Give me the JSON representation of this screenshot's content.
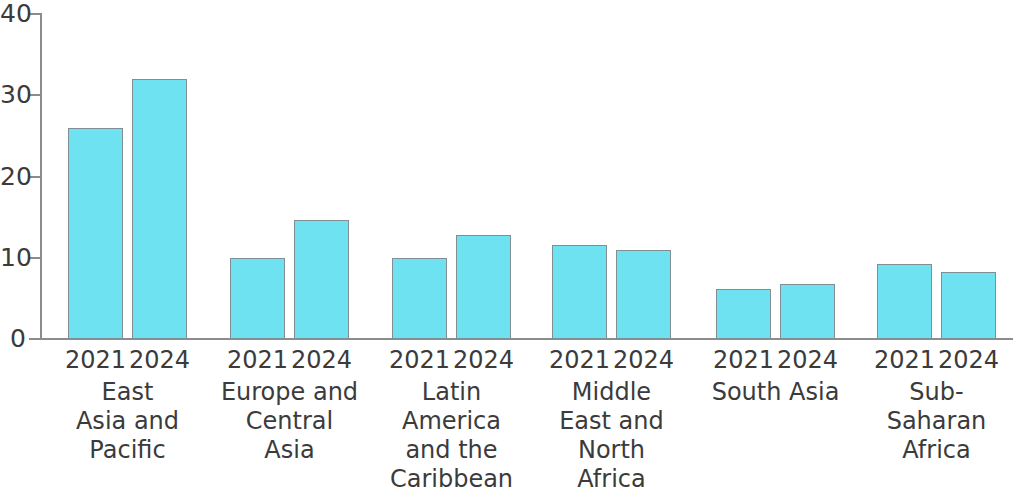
{
  "chart_data": {
    "type": "bar",
    "title": "",
    "subtitle": "",
    "xlabel": "",
    "ylabel": "",
    "ylim": [
      0,
      40
    ],
    "yticks": [
      0,
      10,
      20,
      30,
      40
    ],
    "ytick_labels": [
      "0",
      "10",
      "20",
      "30",
      "40"
    ],
    "grid": false,
    "legend": "none",
    "categories": [
      "East Asia and Pacific",
      "Europe and Central Asia",
      "Latin America and the Caribbean",
      "Middle East and North Africa",
      "South Asia",
      "Sub-Saharan Africa"
    ],
    "sub_categories": [
      "2021",
      "2024"
    ],
    "series": [
      {
        "name": "2021",
        "values": [
          26.0,
          10.0,
          10.0,
          11.6,
          6.2,
          9.2
        ]
      },
      {
        "name": "2024",
        "values": [
          32.0,
          14.7,
          12.8,
          10.9,
          6.8,
          8.3
        ]
      }
    ],
    "colors": {
      "bar_fill": "#6FE2F2",
      "bar_border": "#7f8f93",
      "axis": "#8c8c8c",
      "text": "#3b3b3b",
      "background": "#ffffff"
    }
  },
  "groups": [
    {
      "label": "East\nAsia and\nPacific",
      "bars": [
        {
          "year": "2021",
          "value": 26.0
        },
        {
          "year": "2024",
          "value": 32.0
        }
      ]
    },
    {
      "label": "Europe and\nCentral\nAsia",
      "bars": [
        {
          "year": "2021",
          "value": 10.0
        },
        {
          "year": "2024",
          "value": 14.7
        }
      ]
    },
    {
      "label": "Latin\nAmerica\nand the\nCaribbean",
      "bars": [
        {
          "year": "2021",
          "value": 10.0
        },
        {
          "year": "2024",
          "value": 12.8
        }
      ]
    },
    {
      "label": "Middle\nEast and\nNorth\nAfrica",
      "bars": [
        {
          "year": "2021",
          "value": 11.6
        },
        {
          "year": "2024",
          "value": 10.9
        }
      ]
    },
    {
      "label": "South Asia",
      "bars": [
        {
          "year": "2021",
          "value": 6.2
        },
        {
          "year": "2024",
          "value": 6.8
        }
      ]
    },
    {
      "label": "Sub-\nSaharan\nAfrica",
      "bars": [
        {
          "year": "2021",
          "value": 9.2
        },
        {
          "year": "2024",
          "value": 8.3
        }
      ]
    }
  ],
  "axis": {
    "y_labels": [
      "40",
      "30",
      "20",
      "10",
      "0"
    ]
  }
}
